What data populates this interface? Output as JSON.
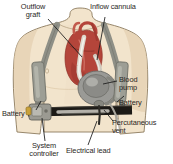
{
  "figure": {
    "background_color": "#ffffff"
  },
  "labels": {
    "outflow_graft": "Outflow\ngraft",
    "inflow_cannula": "Inflow cannula",
    "blood_pump": "Blood\npump",
    "battery_right": "Battery",
    "percutaneous_vent": "Percutaneous\nvent",
    "battery_left": "Battery",
    "system_controller": "System\ncontroller",
    "electrical_lead": "Electrical lead"
  },
  "colors": {
    "skin": "#f2e4cc",
    "skin_shadow": "#e4d0b2",
    "skin_outline": "#8c7a5e",
    "heart": "#b4453a",
    "heart_dark": "#8f3128",
    "heart_light": "#d4776a",
    "strap": "#8e8f86",
    "strap_dark": "#6f7068",
    "pump": "#9a9a96",
    "pump_dark": "#74746f",
    "pump_light": "#b9b9b4",
    "belt": "#1c1a16",
    "belt_inner": "#cfcdc4",
    "controller": "#9b9a92",
    "controller_accent": "#c9a23a",
    "graft": "#ded8cc",
    "leader_line": "#1a1a1a",
    "text": "#2a2724"
  },
  "parts": [
    {
      "name": "outflow-graft",
      "kind": "tube"
    },
    {
      "name": "inflow-cannula",
      "kind": "tube"
    },
    {
      "name": "heart",
      "kind": "organ"
    },
    {
      "name": "blood-pump",
      "kind": "device"
    },
    {
      "name": "battery-left",
      "kind": "device"
    },
    {
      "name": "battery-right",
      "kind": "device"
    },
    {
      "name": "system-controller",
      "kind": "device"
    },
    {
      "name": "electrical-lead",
      "kind": "cable"
    },
    {
      "name": "percutaneous-vent",
      "kind": "cable"
    },
    {
      "name": "shoulder-strap-left",
      "kind": "harness"
    },
    {
      "name": "shoulder-strap-right",
      "kind": "harness"
    },
    {
      "name": "waist-belt",
      "kind": "harness"
    }
  ]
}
